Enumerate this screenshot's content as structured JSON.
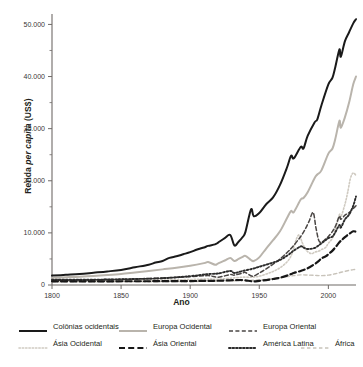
{
  "axes": {
    "ylabel_prefix": "Renda ",
    "ylabel_italic": "per capita",
    "ylabel_suffix": " (US$)",
    "ylabel_full": "Renda per capita (US$)",
    "xlabel": "Ano",
    "y_ticks": [
      "0",
      "10.000",
      "20.000",
      "30.000",
      "40.000",
      "50.000"
    ],
    "x_ticks": [
      "1800",
      "1850",
      "1900",
      "1950",
      "2000"
    ]
  },
  "legend": {
    "rows": [
      [
        {
          "label": "Colônias ocidentais",
          "style": "solid",
          "color": "#1a1a1a",
          "width": 2.1
        },
        {
          "label": "Europa Ocidental",
          "style": "solid",
          "color": "#b9b4ac",
          "width": 1.6
        },
        {
          "label": "Europa Oriental",
          "style": "dashed",
          "color": "#4a4644",
          "width": 1.5
        }
      ],
      [
        {
          "label": "Ásia Ocidental",
          "style": "dotted-light",
          "color": "#cfcac1",
          "width": 1.5
        },
        {
          "label": "Ásia Oriental",
          "style": "longdash",
          "color": "#171717",
          "width": 2.2
        },
        {
          "label": "América Latina",
          "style": "dotted",
          "color": "#2b2b2b",
          "width": 1.8
        },
        {
          "label": "África",
          "style": "dashed-light",
          "color": "#c8c3ba",
          "width": 1.4
        }
      ]
    ]
  },
  "chart_data": {
    "type": "line",
    "title": "",
    "xlabel": "Ano",
    "ylabel": "Renda per capita (US$)",
    "xlim": [
      1800,
      2020
    ],
    "ylim": [
      0,
      52000
    ],
    "grid": false,
    "legend_position": "bottom",
    "y_tick_values": [
      0,
      10000,
      20000,
      30000,
      40000,
      50000
    ],
    "y_minor_tick_values": [
      5000,
      15000,
      25000,
      35000,
      45000
    ],
    "x_tick_values": [
      1800,
      1850,
      1900,
      1950,
      2000
    ],
    "series": [
      {
        "name": "Colônias ocidentais",
        "style": "solid",
        "color": "#1a1a1a",
        "x": [
          1800,
          1810,
          1820,
          1830,
          1840,
          1850,
          1860,
          1870,
          1875,
          1880,
          1885,
          1890,
          1895,
          1900,
          1905,
          1910,
          1913,
          1918,
          1920,
          1925,
          1929,
          1932,
          1935,
          1938,
          1940,
          1944,
          1946,
          1950,
          1955,
          1960,
          1965,
          1970,
          1973,
          1975,
          1980,
          1982,
          1985,
          1990,
          1992,
          1995,
          2000,
          2003,
          2005,
          2008,
          2009,
          2012,
          2015,
          2018,
          2020
        ],
        "y": [
          1800,
          1950,
          2100,
          2350,
          2600,
          2900,
          3400,
          3900,
          4300,
          4600,
          5200,
          5500,
          5900,
          6300,
          6800,
          7200,
          7500,
          7800,
          8100,
          9000,
          9600,
          7600,
          8300,
          9200,
          10200,
          14500,
          13200,
          13800,
          15500,
          16800,
          19200,
          22500,
          24800,
          24300,
          26500,
          26200,
          28600,
          31200,
          31800,
          34500,
          38500,
          39800,
          41800,
          45200,
          43800,
          46800,
          48500,
          50200,
          51000
        ]
      },
      {
        "name": "Europa Ocidental",
        "style": "solid",
        "color": "#b9b4ac",
        "x": [
          1800,
          1810,
          1820,
          1830,
          1840,
          1850,
          1860,
          1870,
          1880,
          1890,
          1900,
          1910,
          1913,
          1918,
          1920,
          1925,
          1929,
          1932,
          1935,
          1938,
          1940,
          1944,
          1946,
          1950,
          1955,
          1960,
          1965,
          1970,
          1973,
          1975,
          1980,
          1982,
          1985,
          1990,
          1992,
          1995,
          2000,
          2003,
          2005,
          2008,
          2009,
          2012,
          2015,
          2018,
          2020
        ],
        "y": [
          1400,
          1500,
          1600,
          1750,
          1900,
          2100,
          2400,
          2700,
          3000,
          3300,
          3700,
          4200,
          4400,
          3900,
          4100,
          4700,
          5200,
          4600,
          5000,
          5400,
          5600,
          4800,
          4600,
          5300,
          7000,
          8600,
          10300,
          12800,
          14200,
          14000,
          16400,
          16700,
          17800,
          20500,
          21200,
          22000,
          25200,
          26200,
          28000,
          31500,
          30200,
          32200,
          35000,
          38500,
          40000
        ]
      },
      {
        "name": "Europa Oriental",
        "style": "dashed",
        "color": "#4a4644",
        "x": [
          1800,
          1820,
          1840,
          1860,
          1880,
          1900,
          1913,
          1920,
          1929,
          1932,
          1938,
          1940,
          1945,
          1950,
          1955,
          1960,
          1965,
          1970,
          1973,
          1975,
          1978,
          1980,
          1983,
          1986,
          1989,
          1991,
          1993,
          1995,
          1998,
          2000,
          2003,
          2005,
          2008,
          2009,
          2012,
          2015,
          2018,
          2020
        ],
        "y": [
          900,
          950,
          1050,
          1150,
          1350,
          1600,
          1800,
          1500,
          2000,
          1900,
          2300,
          2400,
          1700,
          2300,
          3100,
          4000,
          5000,
          6200,
          7000,
          7600,
          8600,
          9300,
          10600,
          12200,
          13900,
          11000,
          8600,
          8200,
          8800,
          9300,
          10300,
          11200,
          13200,
          12600,
          13400,
          13900,
          14700,
          15200
        ]
      },
      {
        "name": "Ásia Ocidental",
        "style": "dotted-light",
        "color": "#cfcac1",
        "x": [
          1800,
          1820,
          1840,
          1860,
          1880,
          1900,
          1913,
          1920,
          1929,
          1938,
          1945,
          1950,
          1955,
          1960,
          1965,
          1970,
          1973,
          1975,
          1977,
          1979,
          1981,
          1983,
          1985,
          1988,
          1990,
          1993,
          1995,
          1998,
          2000,
          2003,
          2005,
          2008,
          2009,
          2012,
          2014,
          2016,
          2018,
          2020
        ],
        "y": [
          800,
          820,
          850,
          900,
          950,
          1050,
          1150,
          1100,
          1300,
          1500,
          1500,
          1700,
          2100,
          2600,
          3300,
          4400,
          5600,
          7200,
          8900,
          9600,
          8200,
          7100,
          6400,
          6000,
          6300,
          6500,
          6800,
          7200,
          8000,
          9000,
          10500,
          13500,
          13000,
          15500,
          17800,
          20500,
          21500,
          21000
        ]
      },
      {
        "name": "Ásia Oriental",
        "style": "longdash",
        "color": "#171717",
        "x": [
          1800,
          1820,
          1840,
          1860,
          1880,
          1900,
          1913,
          1920,
          1929,
          1938,
          1945,
          1950,
          1955,
          1960,
          1965,
          1970,
          1973,
          1975,
          1980,
          1985,
          1990,
          1993,
          1995,
          1998,
          2000,
          2003,
          2005,
          2008,
          2010,
          2012,
          2015,
          2018,
          2020
        ],
        "y": [
          700,
          700,
          710,
          720,
          730,
          760,
          800,
          820,
          900,
          950,
          700,
          800,
          950,
          1150,
          1400,
          1800,
          2100,
          2300,
          2700,
          3200,
          4000,
          4600,
          5100,
          5500,
          5900,
          6600,
          7200,
          8200,
          8700,
          9200,
          9800,
          10300,
          10200
        ]
      },
      {
        "name": "América Latina",
        "style": "dotted",
        "color": "#2b2b2b",
        "x": [
          1800,
          1820,
          1840,
          1860,
          1880,
          1900,
          1913,
          1920,
          1929,
          1932,
          1938,
          1945,
          1950,
          1955,
          1960,
          1965,
          1970,
          1973,
          1975,
          1980,
          1982,
          1985,
          1990,
          1993,
          1995,
          1998,
          2000,
          2003,
          2005,
          2008,
          2009,
          2012,
          2015,
          2018,
          2020
        ],
        "y": [
          1000,
          1000,
          1050,
          1150,
          1300,
          1700,
          2100,
          2200,
          2700,
          2300,
          2700,
          3100,
          3500,
          3900,
          4300,
          4800,
          5600,
          6200,
          6600,
          7400,
          7200,
          6900,
          7100,
          7600,
          8000,
          8600,
          9000,
          9300,
          10100,
          11500,
          11000,
          12600,
          13500,
          15200,
          17000
        ]
      },
      {
        "name": "África",
        "style": "dashed-light",
        "color": "#c8c3ba",
        "x": [
          1800,
          1820,
          1840,
          1860,
          1880,
          1900,
          1913,
          1920,
          1929,
          1938,
          1945,
          1950,
          1955,
          1960,
          1965,
          1970,
          1973,
          1975,
          1980,
          1985,
          1990,
          1995,
          2000,
          2005,
          2010,
          2015,
          2018,
          2020
        ],
        "y": [
          600,
          600,
          610,
          620,
          640,
          670,
          720,
          740,
          800,
          850,
          900,
          980,
          1100,
          1250,
          1400,
          1600,
          1750,
          1800,
          1950,
          1900,
          1850,
          1800,
          1900,
          2150,
          2500,
          2800,
          2950,
          3000
        ]
      }
    ]
  }
}
